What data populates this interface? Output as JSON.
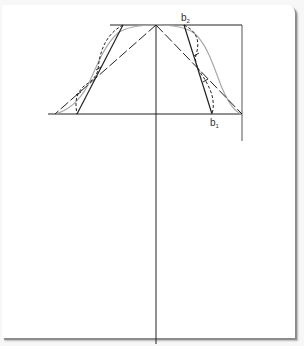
{
  "labels": {
    "b2": {
      "main": "b",
      "sub": "2"
    },
    "b1": {
      "main": "b",
      "sub": "1"
    }
  },
  "colors": {
    "line": "#222222",
    "curve": "#a8a8a8",
    "frame_shadow": "#8a8a8a",
    "background": "#ffffff"
  },
  "geometry": {
    "apex": [
      156,
      25
    ],
    "top_line": {
      "x1": 110,
      "x2": 242,
      "y": 25
    },
    "base_line": {
      "x1": 48,
      "x2": 242,
      "y": 114
    },
    "axis_vertical": {
      "x": 156,
      "y1": 25,
      "y2": 344
    },
    "right_vertical": {
      "x": 242,
      "y1": 25,
      "y2": 141
    }
  }
}
